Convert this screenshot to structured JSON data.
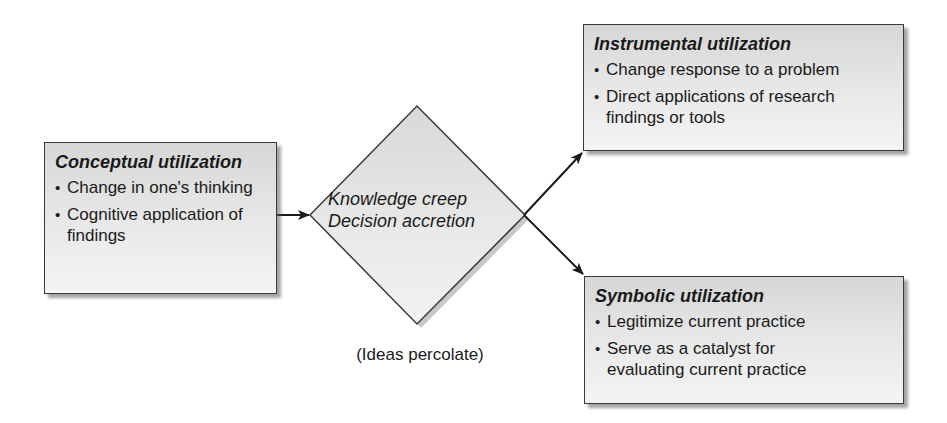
{
  "diagram": {
    "nodes": {
      "conceptual": {
        "title": "Conceptual utilization",
        "bullets": [
          "Change in one's thinking",
          "Cognitive application of findings"
        ]
      },
      "process": {
        "line1": "Knowledge creep",
        "line2": "Decision accretion",
        "caption": "(Ideas percolate)"
      },
      "instrumental": {
        "title": "Instrumental utilization",
        "bullets": [
          "Change response to a problem",
          "Direct applications of research findings or tools"
        ]
      },
      "symbolic": {
        "title": "Symbolic utilization",
        "bullets": [
          "Legitimize current practice",
          "Serve as a catalyst for evaluating current practice"
        ]
      }
    },
    "edges": [
      {
        "from": "conceptual",
        "to": "process"
      },
      {
        "from": "process",
        "to": "instrumental"
      },
      {
        "from": "process",
        "to": "symbolic"
      }
    ],
    "colors": {
      "box_fill_top": "#d6d6d6",
      "box_fill_bottom": "#f4f4f4",
      "border": "#3a3a3a",
      "arrow": "#1a1a1a"
    }
  }
}
